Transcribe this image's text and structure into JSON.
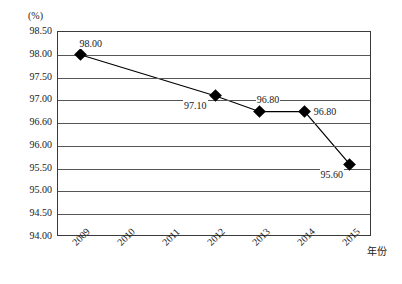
{
  "chart_data": {
    "type": "line",
    "title": "",
    "xlabel": "年份",
    "ylabel": "(%)",
    "unit_label": "(%)",
    "categories": [
      "2009",
      "2010",
      "2011",
      "2012",
      "2013",
      "2014",
      "2015"
    ],
    "series": [
      {
        "name": "",
        "points": [
          {
            "x": "2009",
            "value": 98.0,
            "label": "98.00"
          },
          {
            "x": "2012",
            "value": 97.1,
            "label": "97.10"
          },
          {
            "x": "2013",
            "value": 96.8,
            "label": "96.80"
          },
          {
            "x": "2014",
            "value": 96.8,
            "label": "96.80"
          },
          {
            "x": "2015",
            "value": 95.6,
            "label": "95.60"
          }
        ],
        "marker": "diamond",
        "marker_color": "#000000",
        "line_color": "#000000"
      }
    ],
    "yticks": [
      "98.50",
      "98.00",
      "97.50",
      "97.00",
      "96.60",
      "96.00",
      "95.50",
      "95.00",
      "94.50",
      "94.00"
    ],
    "ylim": [
      94.0,
      98.5
    ],
    "grid": true,
    "legend": "none",
    "axis_color": "#3a3a3a",
    "grid_color": "#555555"
  }
}
